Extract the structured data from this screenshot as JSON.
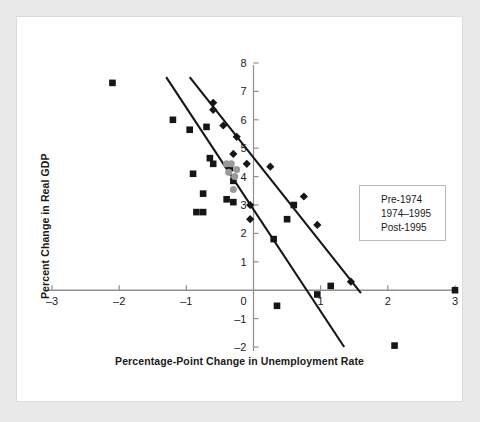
{
  "chart_data": {
    "type": "scatter",
    "title": "",
    "xlabel": "Percentage-Point Change in Unemployment Rate",
    "ylabel": "Percent Change in Real GDP",
    "xlim": [
      -3,
      3
    ],
    "ylim": [
      -2,
      8
    ],
    "xticks": [
      -3,
      -2,
      -1,
      0,
      1,
      2,
      3
    ],
    "yticks": [
      -2,
      -1,
      0,
      1,
      2,
      3,
      4,
      5,
      6,
      7,
      8
    ],
    "xtick_labels": [
      "–3",
      "–2",
      "–1",
      "0",
      "1",
      "2",
      "3"
    ],
    "ytick_labels": [
      "–2",
      "–1",
      "0",
      "1",
      "2",
      "3",
      "4",
      "5",
      "6",
      "7",
      "8"
    ],
    "grid": false,
    "legend_position": "right",
    "series": [
      {
        "name": "Pre-1974",
        "marker": "diamond",
        "color": "#161616",
        "points": [
          [
            -0.6,
            6.6
          ],
          [
            -0.6,
            6.35
          ],
          [
            -0.45,
            5.8
          ],
          [
            -0.25,
            5.4
          ],
          [
            -0.3,
            4.8
          ],
          [
            -0.1,
            4.45
          ],
          [
            0.25,
            4.35
          ],
          [
            0.75,
            3.3
          ],
          [
            -0.05,
            3.0
          ],
          [
            -0.05,
            2.5
          ],
          [
            0.95,
            2.3
          ],
          [
            1.45,
            0.3
          ]
        ]
      },
      {
        "name": "1974–1995",
        "marker": "square",
        "color": "#161616",
        "points": [
          [
            -2.1,
            7.3
          ],
          [
            -1.2,
            6.0
          ],
          [
            -0.95,
            5.65
          ],
          [
            -0.7,
            5.75
          ],
          [
            -0.65,
            4.65
          ],
          [
            -0.6,
            4.45
          ],
          [
            -0.9,
            4.1
          ],
          [
            -0.75,
            3.4
          ],
          [
            -0.35,
            4.3
          ],
          [
            -0.3,
            3.85
          ],
          [
            -0.4,
            3.2
          ],
          [
            -0.3,
            3.1
          ],
          [
            -0.85,
            2.75
          ],
          [
            -0.75,
            2.75
          ],
          [
            0.3,
            1.8
          ],
          [
            0.6,
            3.0
          ],
          [
            0.5,
            2.5
          ],
          [
            1.15,
            0.15
          ],
          [
            0.95,
            -0.15
          ],
          [
            0.35,
            -0.55
          ],
          [
            2.1,
            -1.95
          ],
          [
            3.0,
            0.0
          ]
        ]
      },
      {
        "name": "Post-1995",
        "marker": "circle",
        "color": "#9a9a9a",
        "points": [
          [
            -0.4,
            4.45
          ],
          [
            -0.33,
            4.45
          ],
          [
            -0.37,
            4.15
          ],
          [
            -0.28,
            4.0
          ],
          [
            -0.3,
            3.55
          ],
          [
            -0.25,
            4.25
          ]
        ]
      }
    ],
    "trend_lines": [
      {
        "name": "upper-trend-line",
        "color": "#161616",
        "x1": -0.95,
        "y1": 7.5,
        "x2": 1.6,
        "y2": -0.1
      },
      {
        "name": "lower-trend-line",
        "color": "#161616",
        "x1": -1.3,
        "y1": 7.5,
        "x2": 1.35,
        "y2": -2.0
      }
    ],
    "zero_line": {
      "name": "zero-horizontal-axis",
      "y": 0,
      "color": "#8f8f8f"
    }
  },
  "legend": {
    "items": [
      {
        "label": "Pre-1974",
        "marker": "diamond-marker"
      },
      {
        "label": "1974–1995",
        "marker": "square-marker"
      },
      {
        "label": "Post-1995",
        "marker": "circle-marker"
      }
    ]
  }
}
